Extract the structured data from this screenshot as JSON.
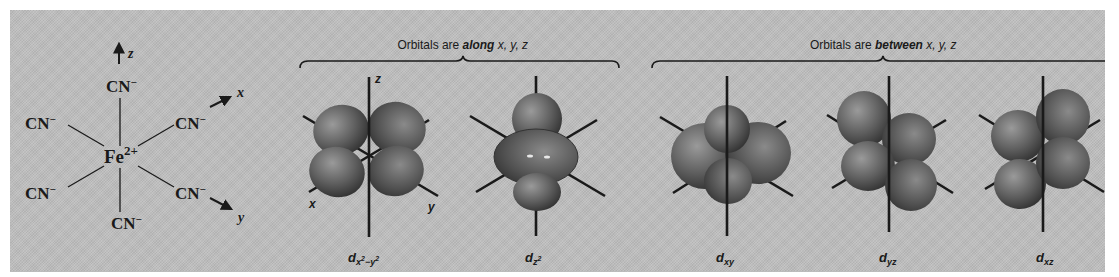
{
  "complex": {
    "metal": "Fe",
    "charge": "2+",
    "ligand": "CN",
    "ligand_charge": "−",
    "axes": {
      "z": "z",
      "x": "x",
      "y": "y"
    }
  },
  "groups": [
    {
      "prefix": "Orbitals are ",
      "emphasis": "along",
      "suffix": " x, y, z"
    },
    {
      "prefix": "Orbitals are ",
      "emphasis": "between",
      "suffix": "  x, y, z"
    }
  ],
  "orbitals": [
    {
      "name": "d",
      "sub": "x",
      "sub_sup1": "2",
      "sub_mid": "−y",
      "sub_sup2": "2",
      "axis_labels": {
        "z": "z",
        "x": "x",
        "y": "y"
      }
    },
    {
      "name": "d",
      "sub": "z",
      "sub_sup1": "2"
    },
    {
      "name": "d",
      "sub": "xy"
    },
    {
      "name": "d",
      "sub": "yz"
    },
    {
      "name": "d",
      "sub": "xz"
    }
  ],
  "colors": {
    "background": "#bdbdbd",
    "ink": "#1a1a1a",
    "lobe_light": "#8c8c8c",
    "lobe_dark": "#2e2e2e"
  }
}
